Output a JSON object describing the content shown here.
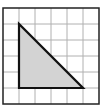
{
  "diagram": {
    "type": "grid-with-triangle",
    "grid": {
      "columns": 6,
      "rows": 6,
      "line_color": "#b0b0b0",
      "border_color": "#222222"
    },
    "triangle": {
      "description": "right triangle",
      "vertices_grid_units": [
        [
          1,
          1
        ],
        [
          1,
          5
        ],
        [
          5,
          5
        ]
      ],
      "fill": "#d3d3d3",
      "stroke": "#111111"
    }
  }
}
